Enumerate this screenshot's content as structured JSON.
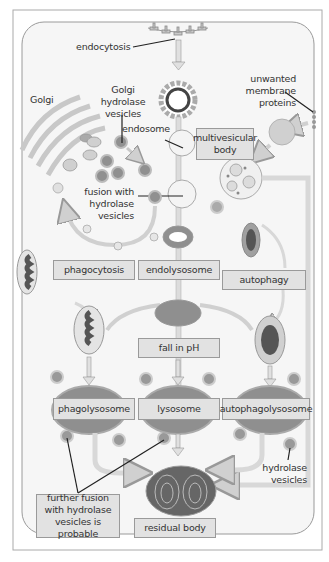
{
  "diagram": {
    "colors": {
      "background": "#ffffff",
      "cell_fill": "#f4f4f4",
      "cell_border": "#9a9a9a",
      "membrane": "#c8c8c8",
      "label_box_fill": "#e2e2e2",
      "vesicle_fill": "#8c8c8c",
      "dark_content": "#555555",
      "leader_line": "#222222"
    },
    "labels": {
      "endocytosis": "endocytosis",
      "golgi": "Golgi",
      "golgi_hydrolase_vesicles": "Golgi hydrolase vesicles",
      "endosome": "endosome",
      "unwanted_membrane_proteins": "unwanted membrane proteins",
      "fusion_with_hydrolase_vesicles": "fusion with hydrolase vesicles",
      "hydrolase_vesicles": "hydrolase vesicles"
    },
    "boxes": {
      "multivesicular_body": "multivesicular body",
      "phagocytosis": "phagocytosis",
      "endolysosome": "endolysosome",
      "autophagy": "autophagy",
      "fall_in_ph": "fall in pH",
      "phagolysosome": "phagolysosome",
      "lysosome": "lysosome",
      "autophagolysosome": "autophagolysosome",
      "further_fusion": "further fusion with hydrolase vesicles is probable",
      "residual_body": "residual body"
    }
  }
}
